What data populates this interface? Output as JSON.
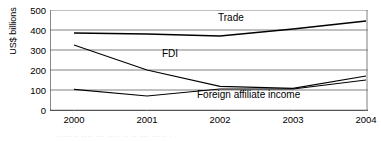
{
  "chart_data": {
    "type": "line",
    "title": "",
    "xlabel": "",
    "ylabel": "US$ billions",
    "categories": [
      "2000",
      "2001",
      "2002",
      "2003",
      "2004"
    ],
    "x": [
      2000,
      2001,
      2002,
      2003,
      2004
    ],
    "ylim": [
      0,
      500
    ],
    "yticks": [
      0,
      100,
      200,
      300,
      400,
      500
    ],
    "ytick_labels": [
      "0",
      "100",
      "200",
      "300",
      "400",
      "500"
    ],
    "grid": true,
    "grid_axis": "y",
    "legend_position": "inline-annotations",
    "series": [
      {
        "name": "Trade",
        "label": "Trade",
        "color": "#000000",
        "values": [
          385,
          380,
          370,
          405,
          445
        ]
      },
      {
        "name": "FDI",
        "label": "FDI",
        "color": "#000000",
        "values": [
          325,
          200,
          118,
          108,
          170
        ]
      },
      {
        "name": "Foreign affiliate income",
        "label": "Foreign affiliate income",
        "color": "#000000",
        "values": [
          103,
          70,
          105,
          105,
          150
        ]
      }
    ],
    "annotations": [
      {
        "text": "Trade",
        "series": "Trade"
      },
      {
        "text": "FDI",
        "series": "FDI"
      },
      {
        "text": "Foreign affiliate income",
        "series": "Foreign affiliate income"
      }
    ]
  },
  "axis": {
    "y_title": "US$ billions"
  },
  "caption": {
    "smudge": "........ .... ... .... ..   ..  ... ..... ."
  }
}
